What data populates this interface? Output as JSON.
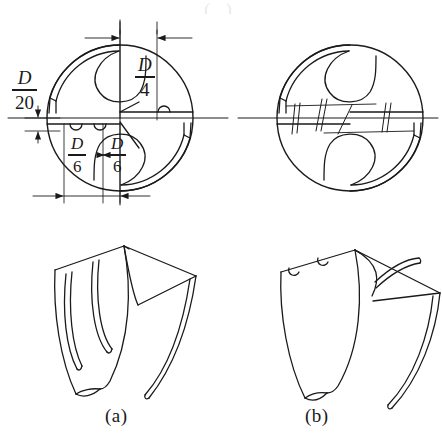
{
  "figure": {
    "title_fragment_top": "( )",
    "background_color": "#ffffff",
    "ink_color": "#1a1a1a",
    "width": 442,
    "height": 442
  },
  "captions": {
    "a": "(a)",
    "b": "(b)"
  },
  "dimensions": {
    "d20": {
      "numerator": "D",
      "denominator": "20",
      "label": "D/20"
    },
    "d4": {
      "numerator": "D",
      "denominator": "4",
      "label": "D/4"
    },
    "d6_left": {
      "numerator": "D",
      "denominator": "6",
      "label": "D/6"
    },
    "d6_right": {
      "numerator": "D",
      "denominator": "6",
      "label": "D/6"
    }
  },
  "views": {
    "top_left": {
      "name": "dimensioned-end-view",
      "shape": "circle",
      "cx": 120,
      "cy": 118,
      "r": 73
    },
    "top_right": {
      "name": "plain-end-view",
      "shape": "circle",
      "cx": 350,
      "cy": 118,
      "r": 73
    },
    "bottom_left": {
      "name": "isometric-drill-point-a"
    },
    "bottom_right": {
      "name": "isometric-drill-point-b"
    }
  }
}
